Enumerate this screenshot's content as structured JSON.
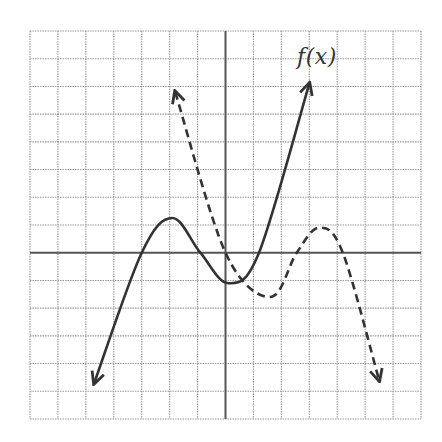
{
  "chart_data": {
    "type": "line",
    "title": "",
    "xlabel": "",
    "ylabel": "",
    "xlim": [
      -7,
      7
    ],
    "ylim": [
      -6,
      8
    ],
    "grid": true,
    "grid_style": "dotted gridlines, one unit per cell",
    "axes": {
      "x_axis_at_y": 0,
      "y_axis_at_x": 0
    },
    "annotations": [
      {
        "text": "f(x)",
        "x": 3.4,
        "y": 6.6
      }
    ],
    "series": [
      {
        "name": "f(x)",
        "style": "solid",
        "color": "#333333",
        "arrows": "both ends",
        "points": [
          {
            "x": -4.7,
            "y": -4.7
          },
          {
            "x": -3.0,
            "y": 0.0
          },
          {
            "x": -1.9,
            "y": 1.25
          },
          {
            "x": -0.9,
            "y": 0.0
          },
          {
            "x": 0.1,
            "y": -1.1
          },
          {
            "x": 1.2,
            "y": 0.0
          },
          {
            "x": 3.0,
            "y": 6.1
          }
        ]
      },
      {
        "name": "dashed curve",
        "style": "dashed",
        "color": "#333333",
        "arrows": "both ends",
        "points": [
          {
            "x": -1.8,
            "y": 5.8
          },
          {
            "x": 0.0,
            "y": 0.0
          },
          {
            "x": 1.6,
            "y": -1.6
          },
          {
            "x": 2.55,
            "y": 0.0
          },
          {
            "x": 3.35,
            "y": 0.9
          },
          {
            "x": 4.2,
            "y": 0.0
          },
          {
            "x": 5.5,
            "y": -4.6
          }
        ]
      }
    ]
  },
  "colors": {
    "grid": "#9a9a9a",
    "axis": "#555555",
    "curve": "#333333",
    "background": "#ffffff"
  },
  "labels": {
    "function_label": "f(x)"
  }
}
